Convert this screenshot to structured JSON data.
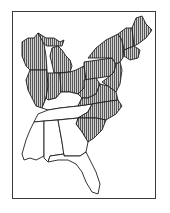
{
  "map": {
    "title": "",
    "region": "Eastern United States",
    "legend": {
      "hatched_fill": "vertical-hatch",
      "hatch_color": "#4a4a4a",
      "outline_color": "#1e1e1e",
      "background": "#ffffff"
    },
    "hatched_regions": [
      "Wisconsin",
      "Michigan",
      "Northern Illinois",
      "Northern Indiana",
      "Ohio",
      "Pennsylvania",
      "New York",
      "Vermont",
      "New Hampshire",
      "Maine",
      "Massachusetts",
      "Connecticut",
      "Rhode Island",
      "New Jersey",
      "Delaware",
      "Maryland",
      "West Virginia",
      "Virginia",
      "North Carolina",
      "South Carolina"
    ],
    "unhatched_regions": [
      "Southern Illinois",
      "Southern Indiana",
      "Kentucky",
      "Tennessee",
      "Mississippi",
      "Alabama",
      "Georgia",
      "Florida"
    ]
  }
}
